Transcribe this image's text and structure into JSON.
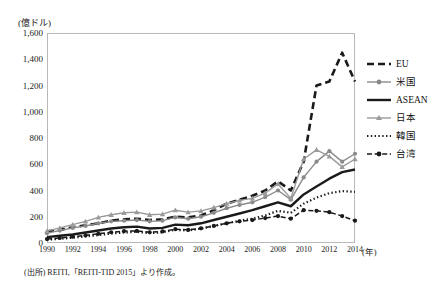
{
  "title": "",
  "unit_label": "(億ドル)",
  "xaxis_unit": "(年)",
  "source_note": "(出所) REITI,「REITI-TID 2015」より作成。",
  "legend": {
    "items": [
      {
        "label": "EU",
        "style": "dashed-bold",
        "color": "#1a1a1a",
        "marker": "none"
      },
      {
        "label": "米国",
        "style": "solid-marker",
        "color": "#8a8a8a",
        "marker": "circle"
      },
      {
        "label": "ASEAN",
        "style": "solid-bold",
        "color": "#1a1a1a",
        "marker": "none"
      },
      {
        "label": "日本",
        "style": "solid-marker",
        "color": "#9a9a9a",
        "marker": "triangle"
      },
      {
        "label": "韓国",
        "style": "dotted",
        "color": "#1a1a1a",
        "marker": "none"
      },
      {
        "label": "台湾",
        "style": "dashdot-marker",
        "color": "#1a1a1a",
        "marker": "circle"
      }
    ]
  },
  "chart_data": {
    "type": "line",
    "title": "",
    "xlabel": "(年)",
    "ylabel": "(億ドル)",
    "ylim": [
      0,
      1600
    ],
    "ytick_step": 200,
    "ytick_labels": [
      "0",
      "200",
      "400",
      "600",
      "800",
      "1,000",
      "1,200",
      "1,400",
      "1,600"
    ],
    "xlim": [
      1990,
      2014
    ],
    "xtick_labels": [
      "1990",
      "1992",
      "1994",
      "1996",
      "1998",
      "2000",
      "2002",
      "2004",
      "2006",
      "2008",
      "2010",
      "2012",
      "2014"
    ],
    "x": [
      1990,
      1991,
      1992,
      1993,
      1994,
      1995,
      1996,
      1997,
      1998,
      1999,
      2000,
      2001,
      2002,
      2003,
      2004,
      2005,
      2006,
      2007,
      2008,
      2009,
      2010,
      2011,
      2012,
      2013,
      2014
    ],
    "grid": false,
    "legend_position": "right",
    "series": [
      {
        "name": "EU",
        "color": "#1a1a1a",
        "style": "dashed-bold",
        "marker": "none",
        "values": [
          90,
          100,
          120,
          135,
          150,
          170,
          180,
          185,
          175,
          180,
          200,
          195,
          210,
          250,
          300,
          330,
          360,
          400,
          470,
          400,
          620,
          1200,
          1230,
          1450,
          1230
        ]
      },
      {
        "name": "米国",
        "color": "#8a8a8a",
        "style": "solid-marker",
        "marker": "circle",
        "values": [
          75,
          95,
          115,
          130,
          150,
          165,
          170,
          175,
          165,
          170,
          195,
          185,
          200,
          230,
          265,
          290,
          310,
          350,
          400,
          330,
          500,
          620,
          700,
          620,
          680
        ]
      },
      {
        "name": "ASEAN",
        "color": "#1a1a1a",
        "style": "solid-bold",
        "marker": "none",
        "values": [
          45,
          55,
          65,
          80,
          95,
          110,
          120,
          125,
          110,
          115,
          140,
          135,
          150,
          175,
          200,
          225,
          250,
          280,
          310,
          280,
          370,
          430,
          490,
          540,
          560
        ]
      },
      {
        "name": "日本",
        "color": "#9a9a9a",
        "style": "solid-marker",
        "marker": "triangle",
        "values": [
          90,
          115,
          140,
          165,
          195,
          215,
          230,
          235,
          215,
          220,
          250,
          235,
          245,
          270,
          300,
          325,
          340,
          380,
          450,
          340,
          640,
          710,
          660,
          580,
          640
        ]
      },
      {
        "name": "韓国",
        "color": "#1a1a1a",
        "style": "dotted",
        "marker": "none",
        "values": [
          25,
          32,
          40,
          50,
          60,
          72,
          80,
          85,
          75,
          82,
          100,
          95,
          110,
          130,
          150,
          170,
          185,
          210,
          245,
          230,
          300,
          345,
          380,
          395,
          390
        ]
      },
      {
        "name": "台湾",
        "color": "#1a1a1a",
        "style": "dashdot-marker",
        "marker": "circle",
        "values": [
          30,
          38,
          48,
          58,
          70,
          82,
          90,
          92,
          82,
          88,
          105,
          100,
          112,
          130,
          150,
          165,
          175,
          190,
          205,
          185,
          250,
          245,
          235,
          205,
          170
        ]
      }
    ]
  }
}
